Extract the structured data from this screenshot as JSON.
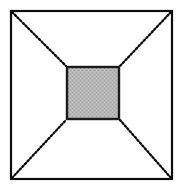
{
  "figure": {
    "canvas": {
      "width": 182,
      "height": 189,
      "background_color": "#ffffff"
    },
    "outer_square": {
      "name": "outer square",
      "x": 11,
      "y": 11,
      "width": 161,
      "height": 168,
      "fill_color": "#ffffff",
      "stroke_color": "#0d0d0d",
      "stroke_width": 2.2,
      "corners": [
        {
          "label": "top-left",
          "x": 11,
          "y": 11
        },
        {
          "label": "top-right",
          "x": 172,
          "y": 11
        },
        {
          "label": "bottom-right",
          "x": 172,
          "y": 179
        },
        {
          "label": "bottom-left",
          "x": 11,
          "y": 179
        }
      ]
    },
    "inner_square": {
      "name": "inner shaded square",
      "x": 67,
      "y": 67,
      "width": 52,
      "height": 52,
      "fill_color": "#b4b4b4",
      "fill_style": "stippled-gray",
      "stroke_color": "#1a1a1a",
      "stroke_width": 2.4,
      "corners": [
        {
          "label": "top-left",
          "x": 67,
          "y": 67
        },
        {
          "label": "top-right",
          "x": 119,
          "y": 67
        },
        {
          "label": "bottom-right",
          "x": 119,
          "y": 119
        },
        {
          "label": "bottom-left",
          "x": 67,
          "y": 119
        }
      ]
    },
    "diagonals": {
      "name": "dotted corner connectors",
      "count": 4,
      "stroke_color": "#0a0a0a",
      "stroke_width": 2.3,
      "dash_pattern": "1.6 2.2",
      "line_style": "dotted",
      "lines": [
        {
          "label": "top-left-diagonal",
          "x1": 12,
          "y1": 12,
          "x2": 66,
          "y2": 66
        },
        {
          "label": "top-right-diagonal",
          "x1": 171,
          "y1": 12,
          "x2": 120,
          "y2": 66
        },
        {
          "label": "bottom-right-diagonal",
          "x1": 171,
          "y1": 178,
          "x2": 120,
          "y2": 120
        },
        {
          "label": "bottom-left-diagonal",
          "x1": 12,
          "y1": 178,
          "x2": 66,
          "y2": 120
        }
      ]
    }
  }
}
